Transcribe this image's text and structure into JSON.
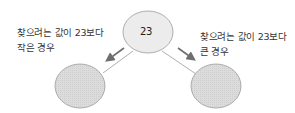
{
  "root": {
    "value": "23"
  },
  "left": {
    "line1": "찾으려는 값이 23보다",
    "line2": "작은 경우"
  },
  "right": {
    "line1": "찾으려는 값이 23보다",
    "line2": "큰 경우"
  },
  "colors": {
    "root_fill": "#ececec",
    "child_fill": "#d9d9d9",
    "stroke": "#9a9a9a",
    "arrow": "#6e6e6e"
  }
}
